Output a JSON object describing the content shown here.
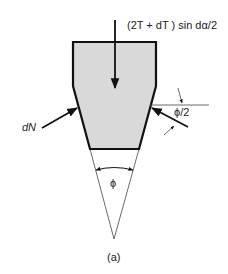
{
  "diagram": {
    "labels": {
      "force_top": "(2T + dT ) sin dα/2",
      "normal_force": "dN",
      "half_angle": "ϕ/2",
      "groove_angle": "ϕ",
      "caption": "(a)"
    },
    "colors": {
      "fill": "#d9d9d9",
      "stroke": "#111111",
      "thin_line": "#444444"
    }
  }
}
